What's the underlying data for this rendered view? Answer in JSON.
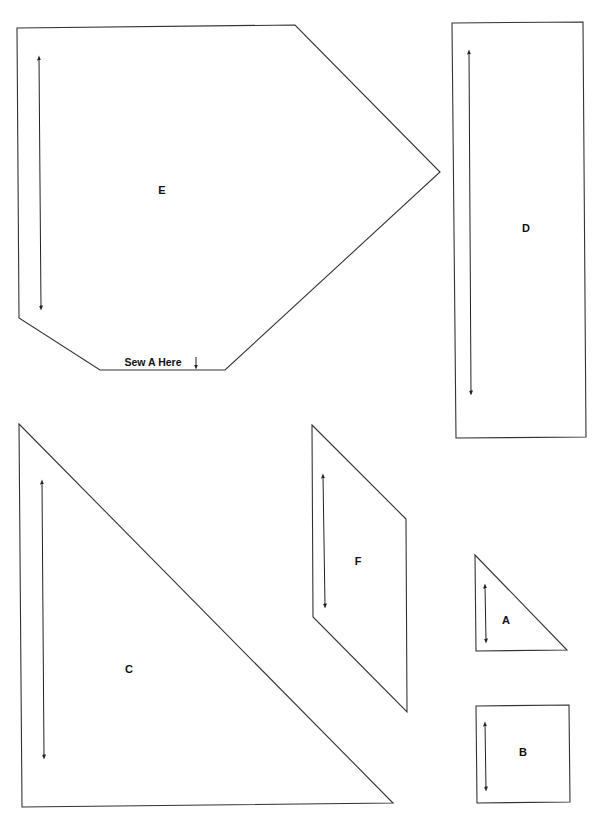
{
  "colors": {
    "outline": "#333333",
    "background": "#ffffff",
    "text": "#111111"
  },
  "pieces": [
    {
      "id": "E",
      "label": "E",
      "shape": "hexagon-pentagon",
      "note": "Sew A Here",
      "note_icon": "arrow-down-icon"
    },
    {
      "id": "D",
      "label": "D",
      "shape": "rectangle"
    },
    {
      "id": "C",
      "label": "C",
      "shape": "right-triangle"
    },
    {
      "id": "F",
      "label": "F",
      "shape": "parallelogram"
    },
    {
      "id": "A",
      "label": "A",
      "shape": "right-triangle"
    },
    {
      "id": "B",
      "label": "B",
      "shape": "square"
    }
  ],
  "grainline_icon": "double-arrow-icon"
}
